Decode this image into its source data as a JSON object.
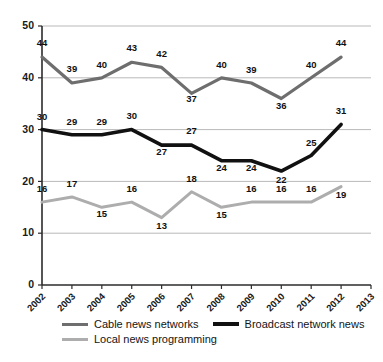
{
  "chart_data": {
    "type": "line",
    "title": "",
    "subtitle": "",
    "xlabel": "",
    "ylabel": "",
    "x": [
      "2002",
      "2003",
      "2004",
      "2005",
      "2006",
      "2007",
      "2008",
      "2009",
      "2010",
      "2011",
      "2012"
    ],
    "xtick_labels": [
      "2002",
      "2003",
      "2004",
      "2005",
      "2006",
      "2007",
      "2008",
      "2009",
      "2010",
      "2011",
      "2012",
      "2013"
    ],
    "ytick_labels": [
      "0",
      "10",
      "20",
      "30",
      "40",
      "50"
    ],
    "yticks": [
      0,
      10,
      20,
      30,
      40,
      50
    ],
    "ylim": [
      0,
      50
    ],
    "grid": true,
    "grid_axis": "y",
    "legend_position": "bottom-left",
    "data_labels": true,
    "series": [
      {
        "name": "Cable news networks",
        "color": "#6e6e6e",
        "width": 3.2,
        "values": [
          44,
          39,
          40,
          43,
          42,
          37,
          40,
          39,
          36,
          40,
          44
        ]
      },
      {
        "name": "Broadcast network news",
        "color": "#111111",
        "width": 3.6,
        "values": [
          30,
          29,
          29,
          30,
          27,
          27,
          24,
          24,
          22,
          25,
          31
        ]
      },
      {
        "name": "Local news programming",
        "color": "#adadad",
        "width": 3.0,
        "values": [
          16,
          17,
          15,
          16,
          13,
          18,
          15,
          16,
          16,
          16,
          19
        ]
      }
    ]
  },
  "legend": {
    "rows": [
      [
        {
          "label": "Cable news networks",
          "color": "#6e6e6e",
          "width": 3
        },
        {
          "label": "Broadcast network news",
          "color": "#111111",
          "width": 4
        }
      ],
      [
        {
          "label": "Local news programming",
          "color": "#adadad",
          "width": 3
        }
      ]
    ]
  },
  "colors": {
    "axis": "#2b2b2b",
    "grid": "#b9b9b9",
    "background": "#ffffff",
    "cable": "#6e6e6e",
    "broadcast": "#111111",
    "local": "#adadad"
  }
}
